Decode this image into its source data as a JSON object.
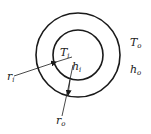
{
  "diagram": {
    "colors": {
      "stroke": "#1a1a1a",
      "text": "#222222",
      "background": "#ffffff"
    },
    "outer_circle": {
      "cx": 78,
      "cy": 55,
      "r": 42
    },
    "inner_circle": {
      "cx": 78,
      "cy": 55,
      "r": 25
    },
    "labels": {
      "T_i": {
        "main": "T",
        "sub": "i"
      },
      "h_i": {
        "main": "h",
        "sub": "i"
      },
      "T_o": {
        "main": "T",
        "sub": "o"
      },
      "h_o": {
        "main": "h",
        "sub": "o"
      },
      "r_i": {
        "main": "r",
        "sub": "i"
      },
      "r_o": {
        "main": "r",
        "sub": "o"
      }
    }
  }
}
